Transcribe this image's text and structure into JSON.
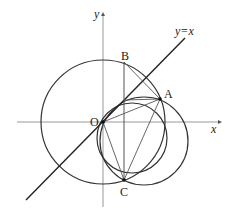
{
  "diagram": {
    "type": "geometry-figure",
    "axes": {
      "x_label": "x",
      "y_label": "y",
      "origin_label": "O",
      "x_axis": {
        "x1": 17,
        "x2": 218,
        "y": 122
      },
      "y_axis": {
        "x": 103,
        "y1": 12,
        "y2": 207
      }
    },
    "line_y_eq_x": {
      "label": "y=x",
      "x1": 26,
      "y1": 200,
      "x2": 185,
      "y2": 38
    },
    "points": {
      "O": {
        "label": "O",
        "x": 103,
        "y": 122
      },
      "A": {
        "label": "A",
        "x": 160,
        "y": 99
      },
      "B": {
        "label": "B",
        "x": 124,
        "y": 62
      },
      "C": {
        "label": "C",
        "x": 124,
        "y": 180
      },
      "P": {
        "x": 124,
        "y": 100
      }
    },
    "circles": [
      {
        "name": "big-circle",
        "cx": 103,
        "cy": 122,
        "r": 62
      },
      {
        "name": "circle-inner",
        "cx": 132,
        "cy": 138,
        "r": 35
      },
      {
        "name": "circle-right",
        "cx": 144,
        "cy": 141,
        "r": 44
      }
    ],
    "segments": [
      {
        "name": "segment-BC",
        "from": "B",
        "to": "C"
      },
      {
        "name": "segment-BA",
        "from": "B",
        "to": "A"
      },
      {
        "name": "segment-PA",
        "from": "P",
        "to": "A"
      },
      {
        "name": "segment-OA",
        "from": "O",
        "to": "A"
      },
      {
        "name": "segment-OC",
        "from": "O",
        "to": "C"
      },
      {
        "name": "segment-AC",
        "from": "A",
        "to": "C"
      }
    ]
  }
}
